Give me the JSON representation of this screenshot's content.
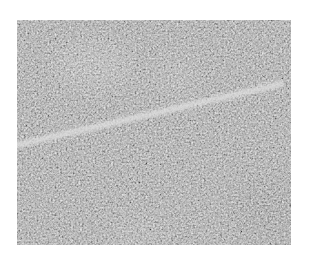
{
  "canvas": {
    "width": 309,
    "height": 266,
    "background": "#ffffff"
  },
  "image": {
    "kind": "grayscale noisy texture with bright linear streak",
    "frame": {
      "x": 17,
      "y": 20,
      "width": 274,
      "height": 225
    },
    "base_color": "#9c9c9c",
    "noise": {
      "base_frequency": 0.55,
      "octaves": 2,
      "seed": 7,
      "contrast": 1.9,
      "opacity": 0.85
    },
    "blobs": [
      {
        "cx": 75,
        "cy": 45,
        "rx": 40,
        "ry": 25,
        "color": "#b4b4b4",
        "opacity": 0.55
      },
      {
        "cx": 160,
        "cy": 55,
        "rx": 22,
        "ry": 25,
        "color": "#b0b0b0",
        "opacity": 0.45
      },
      {
        "cx": 120,
        "cy": 215,
        "rx": 30,
        "ry": 18,
        "color": "#b0b0b0",
        "opacity": 0.35
      },
      {
        "cx": 250,
        "cy": 190,
        "rx": 35,
        "ry": 30,
        "color": "#8a8a8a",
        "opacity": 0.35
      }
    ],
    "streak": {
      "x1": 0,
      "y1": 125,
      "x2": 264,
      "y2": 64,
      "color": "#e2e2e2",
      "width": 6,
      "blur": 1.4,
      "opacity": 0.95
    }
  }
}
